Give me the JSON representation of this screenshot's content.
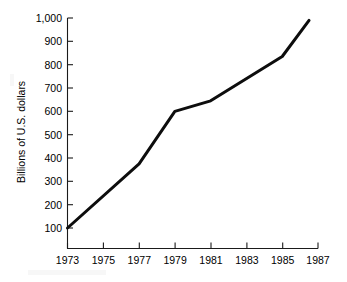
{
  "chart_data": {
    "type": "line",
    "title": "",
    "subtitle": "",
    "xlabel": "",
    "ylabel": "Billions of U.S. dollars",
    "xlim": [
      1973,
      1987
    ],
    "ylim": [
      0,
      1000
    ],
    "grid": false,
    "legend": false,
    "legend_position": "none",
    "x_tick_labels": [
      "1973",
      "1975",
      "1977",
      "1979",
      "1981",
      "1983",
      "1985",
      "1987"
    ],
    "x_tick_values": [
      1973,
      1975,
      1977,
      1979,
      1981,
      1983,
      1985,
      1987
    ],
    "y_tick_labels": [
      "1,000",
      "900",
      "800",
      "700",
      "600",
      "500",
      "400",
      "300",
      "200",
      "100"
    ],
    "y_tick_values": [
      1000,
      900,
      800,
      700,
      600,
      500,
      400,
      300,
      200,
      100
    ],
    "x": [
      1973,
      1977,
      1979,
      1981,
      1985,
      1986.5
    ],
    "values": [
      100,
      375,
      600,
      645,
      835,
      990
    ],
    "series": [
      {
        "name": "Billions of U.S. dollars",
        "color": "#0d0d0d",
        "x": [
          1973,
          1977,
          1979,
          1981,
          1985,
          1986.5
        ],
        "values": [
          100,
          375,
          600,
          645,
          835,
          990
        ]
      }
    ],
    "annotations": []
  },
  "axes": {
    "y_title": "Billions of U.S. dollars"
  },
  "ticks": {
    "y": [
      {
        "label": "1,000",
        "value": 1000
      },
      {
        "label": "900",
        "value": 900
      },
      {
        "label": "800",
        "value": 800
      },
      {
        "label": "700",
        "value": 700
      },
      {
        "label": "600",
        "value": 600
      },
      {
        "label": "500",
        "value": 500
      },
      {
        "label": "400",
        "value": 400
      },
      {
        "label": "300",
        "value": 300
      },
      {
        "label": "200",
        "value": 200
      },
      {
        "label": "100",
        "value": 100
      }
    ],
    "x": [
      {
        "label": "1973",
        "value": 1973
      },
      {
        "label": "1975",
        "value": 1975
      },
      {
        "label": "1977",
        "value": 1977
      },
      {
        "label": "1979",
        "value": 1979
      },
      {
        "label": "1981",
        "value": 1981
      },
      {
        "label": "1983",
        "value": 1983
      },
      {
        "label": "1985",
        "value": 1985
      },
      {
        "label": "1987",
        "value": 1987
      }
    ]
  },
  "colors": {
    "line": "#0d0d0d",
    "axis": "#1a1a1a",
    "background": "#ffffff",
    "text": "#000000"
  }
}
